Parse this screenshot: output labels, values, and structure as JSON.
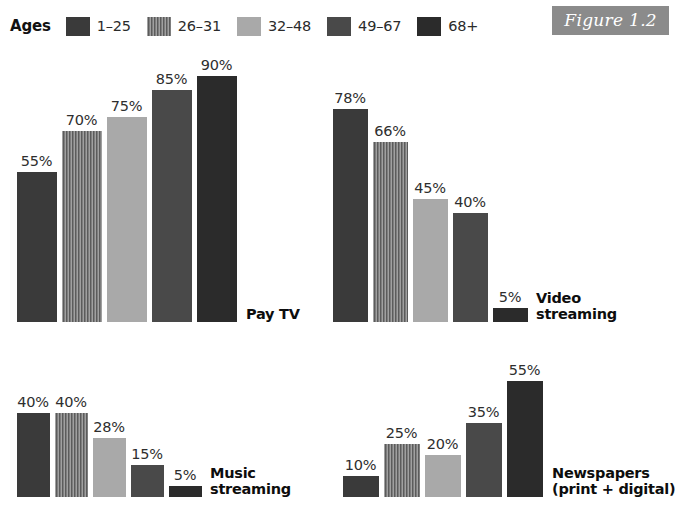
{
  "figure": {
    "tag": "Figure 1.2",
    "tag_bg": "#8b8b8b",
    "background": "#ffffff"
  },
  "legend": {
    "title": "Ages",
    "entries": [
      {
        "label": "1–25",
        "color": "#3a3a3a",
        "pattern": "solid"
      },
      {
        "label": "26–31",
        "color": "#6f6f6f",
        "pattern": "vertical-hatch"
      },
      {
        "label": "32–48",
        "color": "#a9a9a9",
        "pattern": "solid"
      },
      {
        "label": "49–67",
        "color": "#494949",
        "pattern": "solid"
      },
      {
        "label": "68+",
        "color": "#2b2b2b",
        "pattern": "solid"
      }
    ]
  },
  "chart_data": {
    "type": "bar",
    "title": "Figure 1.2",
    "xlabel": "",
    "ylabel": "",
    "ylim": [
      0,
      100
    ],
    "grid": false,
    "legend_position": "top-left",
    "value_suffix": "%",
    "categories": [
      "1–25",
      "26–31",
      "32–48",
      "49–67",
      "68+"
    ],
    "panels": [
      {
        "name": "Pay TV",
        "label_lines": [
          "Pay TV"
        ],
        "values": [
          55,
          70,
          75,
          85,
          90
        ],
        "value_labels": [
          "55%",
          "70%",
          "75%",
          "85%",
          "90%"
        ]
      },
      {
        "name": "Video streaming",
        "label_lines": [
          "Video",
          "streaming"
        ],
        "values": [
          78,
          66,
          45,
          40,
          5
        ],
        "value_labels": [
          "78%",
          "66%",
          "45%",
          "40%",
          "5%"
        ]
      },
      {
        "name": "Music streaming",
        "label_lines": [
          "Music",
          "streaming"
        ],
        "values": [
          40,
          40,
          28,
          15,
          5
        ],
        "value_labels": [
          "40%",
          "40%",
          "28%",
          "15%",
          "5%"
        ]
      },
      {
        "name": "Newspapers (print + digital)",
        "label_lines": [
          "Newspapers",
          "(print + digital)"
        ],
        "values": [
          10,
          25,
          20,
          35,
          55
        ],
        "value_labels": [
          "10%",
          "25%",
          "20%",
          "35%",
          "55%"
        ]
      }
    ]
  }
}
